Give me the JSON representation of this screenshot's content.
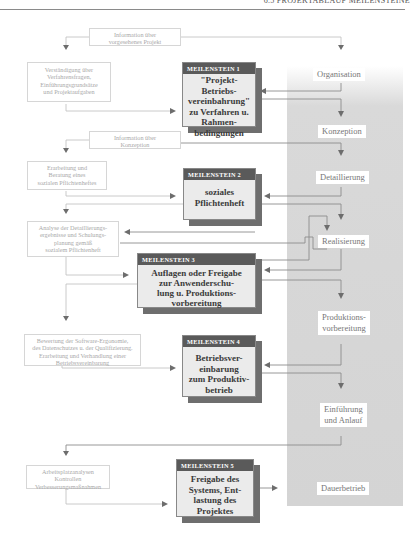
{
  "header": {
    "running_title": "6.5 PROJEKTABLAUF MEILENSTEINE"
  },
  "phases": [
    {
      "id": "organisation",
      "label": "Organisation"
    },
    {
      "id": "konzeption",
      "label": "Konzeption"
    },
    {
      "id": "detaillierung",
      "label": "Detaillierung"
    },
    {
      "id": "realisierung",
      "label": "Realisierung"
    },
    {
      "id": "produktionsvorbereitung",
      "label_line1": "Produktions-",
      "label_line2": "vorbereitung"
    },
    {
      "id": "einfuehrung",
      "label_line1": "Einführung",
      "label_line2": "und Anlauf"
    },
    {
      "id": "dauerbetrieb",
      "label": "Dauerbetrieb"
    }
  ],
  "info_boxes": [
    {
      "lines": [
        "Information über",
        "vorgesehenes Projekt"
      ]
    },
    {
      "lines": [
        "Verständigung über",
        "Verfahrensfragen,",
        "Einführungsgrundsätze",
        "und Projektaufgaben"
      ]
    },
    {
      "lines": [
        "Information über",
        "Konzeption"
      ]
    },
    {
      "lines": [
        "Erarbeitung und",
        "Beratung eines",
        "sozialen Pflichtenheftes"
      ]
    },
    {
      "lines": [
        "Analyse der Detaillierungs-",
        "ergebnisse und Schulungs-",
        "planung gemäß",
        "sozialem Pflichtenheft"
      ]
    },
    {
      "lines": [
        "Bewertung der Software-Ergonomie,",
        "des Datenschutzes u. der Qualifizierung.",
        "Erarbeitung und Verhandlung einer",
        "Betriebsvereinbarung"
      ]
    },
    {
      "lines": [
        "Arbeitsplatzanalysen",
        "Kontrollen",
        "Verbesserungsmaßnahmen"
      ]
    }
  ],
  "milestones": [
    {
      "header": "MEILENSTEIN 1",
      "lines": [
        "\"Projekt-Betriebs-",
        "vereinbahrung\"",
        "zu Verfahren u.",
        "Rahmen-",
        "bedingungen"
      ]
    },
    {
      "header": "MEILENSTEIN 2",
      "lines": [
        "soziales",
        "Pflichtenheft"
      ]
    },
    {
      "header": "MEILENSTEIN 3",
      "lines": [
        "Auflagen oder Freigabe",
        "zur Anwenderschu-",
        "lung u. Produktions-",
        "vorbereitung"
      ]
    },
    {
      "header": "MEILENSTEIN 4",
      "lines": [
        "Betriebsver-",
        "einbarung",
        "zum Produktiv-",
        "betrieb"
      ]
    },
    {
      "header": "MEILENSTEIN 5",
      "lines": [
        "Freigabe des",
        "Systems, Ent-",
        "lastung des",
        "Projektes"
      ]
    }
  ],
  "colors": {
    "milestone_header": "#5a5a5a",
    "milestone_body": "#ebebeb",
    "milestone_shadow": "#6e6e6e",
    "phase_band": "#d6d6d6",
    "line": "#8c8c8c"
  }
}
